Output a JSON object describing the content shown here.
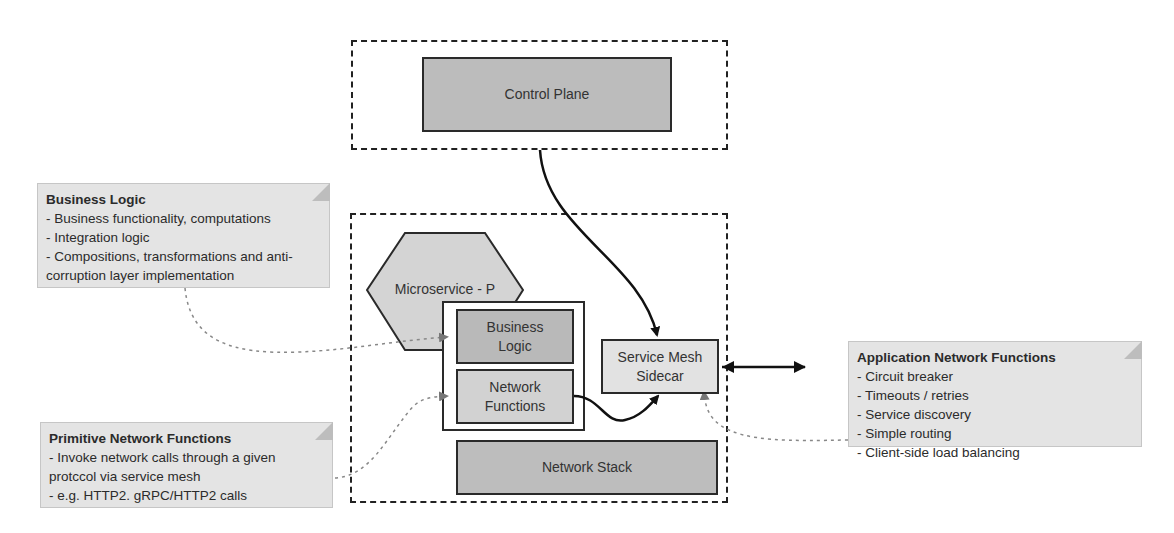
{
  "control_plane": {
    "label": "Control Plane"
  },
  "microservice": {
    "label": "Microservice - P"
  },
  "components": {
    "business_logic": "Business Logic",
    "network_functions": "Network Functions",
    "network_stack": "Network Stack",
    "sidecar": "Service Mesh Sidecar"
  },
  "notes": {
    "business_logic": {
      "title": "Business Logic",
      "lines": [
        "- Business functionality, computations",
        "- Integration logic",
        "- Compositions, transformations and anti-corruption layer implementation"
      ]
    },
    "primitive_network": {
      "title": "Primitive Network Functions",
      "lines": [
        "- Invoke network calls through a given protccol via service mesh",
        "- e.g. HTTP2. gRPC/HTTP2 calls"
      ]
    },
    "application_network": {
      "title": "Application Network Functions",
      "lines": [
        "- Circuit breaker",
        "- Timeouts / retries",
        "- Service discovery",
        "- Simple routing",
        "- Client-side load balancing"
      ]
    }
  },
  "colors": {
    "control_plane_fill": "#bcbcbc",
    "business_logic_fill": "#b9b9b9",
    "network_functions_fill": "#d2d2d2",
    "network_stack_fill": "#bdbdbd",
    "sidecar_fill": "#e2e2e2",
    "hexagon_fill": "#d4d4d4",
    "note_fill": "#e4e4e4"
  }
}
